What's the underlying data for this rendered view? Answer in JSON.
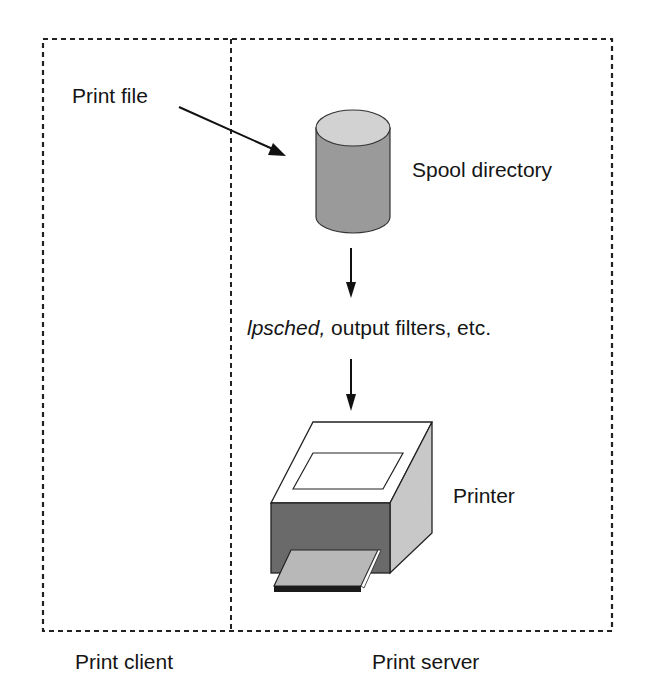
{
  "diagram": {
    "labels": {
      "print_file": "Print file",
      "spool_directory": "Spool directory",
      "lpsched_prefix": "lpsched,",
      "filters_rest": " output filters, etc.",
      "printer": "Printer",
      "print_client": "Print client",
      "print_server": "Print server"
    },
    "colors": {
      "cylinder_body": "#9a9a9a",
      "cylinder_top": "#d2d2d2",
      "printer_front": "#6a6a6a",
      "printer_side": "#c8c8c8",
      "printer_top": "#ffffff",
      "paper": "#b8b8b8",
      "line": "#111111"
    }
  }
}
